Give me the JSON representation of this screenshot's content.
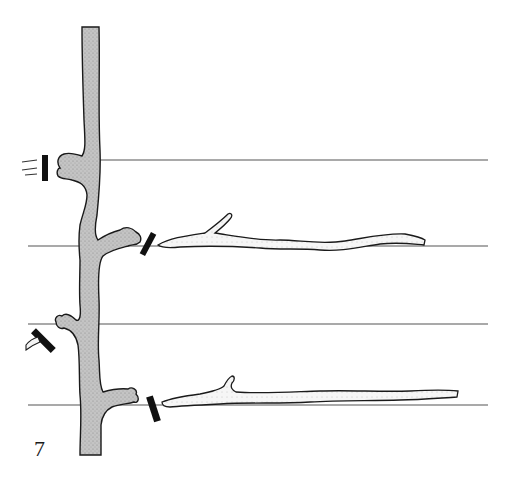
{
  "figure": {
    "number_label": "7",
    "colors": {
      "background": "#ffffff",
      "trunk_fill": "#c4c4c4",
      "outline": "#1a1a1a",
      "wire": "#555555",
      "cut_mark": "#111111",
      "cane_fill": "#f4f4f4"
    },
    "wires": [
      {
        "y": 160,
        "x_start": 100,
        "x_end": 488
      },
      {
        "y": 246,
        "x_start": 28,
        "x_end": 488
      },
      {
        "y": 324,
        "x_start": 28,
        "x_end": 488
      },
      {
        "y": 405,
        "x_start": 28,
        "x_end": 488
      }
    ],
    "elements": [
      "trunk",
      "spur-upper-left (cut)",
      "cane-upper-right (cut, laid along wire 2)",
      "spur-lower-left (cut)",
      "cane-lower-right (cut, laid along wire 4)"
    ]
  }
}
